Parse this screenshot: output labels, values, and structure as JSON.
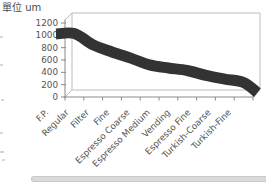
{
  "chart_data": {
    "type": "line",
    "style": "3d-ribbon",
    "title": "單位 um",
    "ylabel": "單位 um",
    "xlabel": "",
    "categories": [
      "F.P.",
      "Regular",
      "Filter",
      "Fine",
      "Espresso Coarse",
      "Espresso Medium",
      "Vending",
      "Espresso Fine",
      "Turkish-Coarse",
      "Turkish-Fine"
    ],
    "values": [
      1030,
      845,
      730,
      630,
      520,
      470,
      430,
      350,
      290,
      235
    ],
    "ylim": [
      0,
      1200
    ],
    "yticks": [
      1200,
      1000,
      800,
      600,
      400,
      200,
      0
    ],
    "grid": false,
    "legend_position": "none",
    "series_color": "#333333"
  },
  "colors": {
    "ribbon": "#333333",
    "axis": "#8a8a8a",
    "wall": "#bdbdbd",
    "tick_text": "#555555",
    "title_text": "#4a4a4a",
    "scrollbar_fill": "#d9d9d9",
    "scrollbar_border": "#c9c9c9"
  }
}
